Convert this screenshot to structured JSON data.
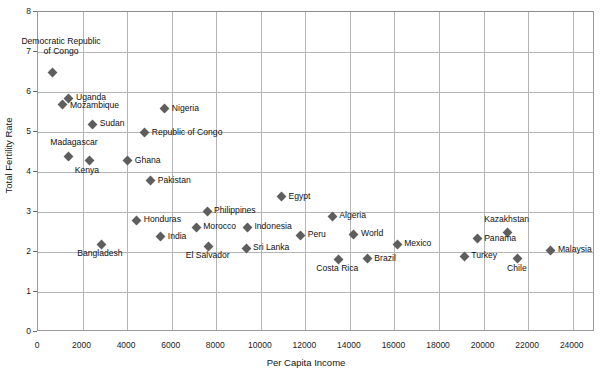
{
  "chart_data": {
    "type": "scatter",
    "title": "",
    "xlabel": "Per Capita Income",
    "ylabel": "Total Fertility Rate",
    "xlim": [
      0,
      25000
    ],
    "ylim": [
      0,
      8
    ],
    "xticks": [
      0,
      2000,
      4000,
      6000,
      8000,
      10000,
      12000,
      14000,
      16000,
      18000,
      20000,
      22000,
      24000
    ],
    "yticks": [
      0,
      1,
      2,
      3,
      4,
      5,
      6,
      7,
      8
    ],
    "xtick_labels": [
      "0",
      "2000",
      "4000",
      "6000",
      "8000",
      "10000",
      "12000",
      "14000",
      "16000",
      "18000",
      "20000",
      "22000",
      "24000"
    ],
    "ytick_labels": [
      "0",
      "1",
      "2",
      "3",
      "4",
      "5",
      "6",
      "7",
      "8"
    ],
    "grid": true,
    "legend": false,
    "marker_color": "#5e5e5e",
    "marker_shape": "diamond",
    "points": [
      {
        "label": "Democratic Republic\nof Congo",
        "x": 630,
        "y": 6.5,
        "label_pos": "above-right",
        "dx": 10,
        "dy": -34
      },
      {
        "label": "Uganda",
        "x": 1390,
        "y": 5.85,
        "label_pos": "right",
        "dx": 8,
        "dy": -4
      },
      {
        "label": "Mozambique",
        "x": 1120,
        "y": 5.68,
        "label_pos": "right",
        "dx": 8,
        "dy": -3
      },
      {
        "label": "Nigeria",
        "x": 5690,
        "y": 5.58,
        "label_pos": "right",
        "dx": 8,
        "dy": -4
      },
      {
        "label": "Sudan",
        "x": 2460,
        "y": 5.2,
        "label_pos": "right",
        "dx": 8,
        "dy": -4
      },
      {
        "label": "Republic of Congo",
        "x": 4790,
        "y": 4.98,
        "label_pos": "right",
        "dx": 8,
        "dy": -4
      },
      {
        "label": "Madagascar",
        "x": 1390,
        "y": 4.4,
        "label_pos": "above",
        "dx": 6,
        "dy": -17
      },
      {
        "label": "Kenya",
        "x": 2330,
        "y": 4.28,
        "label_pos": "below",
        "dx": -2,
        "dy": 6
      },
      {
        "label": "Ghana",
        "x": 4030,
        "y": 4.28,
        "label_pos": "right",
        "dx": 8,
        "dy": -4
      },
      {
        "label": "Pakistan",
        "x": 5060,
        "y": 3.78,
        "label_pos": "right",
        "dx": 8,
        "dy": -4
      },
      {
        "label": "Egypt",
        "x": 10930,
        "y": 3.38,
        "label_pos": "right",
        "dx": 8,
        "dy": -4
      },
      {
        "label": "Philippines",
        "x": 7590,
        "y": 3.02,
        "label_pos": "right",
        "dx": 8,
        "dy": -4
      },
      {
        "label": "Algeria",
        "x": 13210,
        "y": 2.9,
        "label_pos": "right",
        "dx": 8,
        "dy": -4
      },
      {
        "label": "Kazakhstan",
        "x": 21080,
        "y": 2.48,
        "label_pos": "above",
        "dx": 0,
        "dy": -17
      },
      {
        "label": "Honduras",
        "x": 4430,
        "y": 2.8,
        "label_pos": "right",
        "dx": 8,
        "dy": -4
      },
      {
        "label": "Morocco",
        "x": 7100,
        "y": 2.62,
        "label_pos": "right",
        "dx": 8,
        "dy": -4
      },
      {
        "label": "Indonesia",
        "x": 9400,
        "y": 2.62,
        "label_pos": "right",
        "dx": 8,
        "dy": -4
      },
      {
        "label": "Peru",
        "x": 11790,
        "y": 2.42,
        "label_pos": "right",
        "dx": 8,
        "dy": -4
      },
      {
        "label": "World",
        "x": 14180,
        "y": 2.45,
        "label_pos": "right",
        "dx": 8,
        "dy": -4
      },
      {
        "label": "Panama",
        "x": 19710,
        "y": 2.33,
        "label_pos": "right",
        "dx": 8,
        "dy": -4
      },
      {
        "label": "India",
        "x": 5510,
        "y": 2.38,
        "label_pos": "right",
        "dx": 8,
        "dy": -4
      },
      {
        "label": "Mexico",
        "x": 16120,
        "y": 2.2,
        "label_pos": "right",
        "dx": 8,
        "dy": -4
      },
      {
        "label": "Bangladesh",
        "x": 2870,
        "y": 2.2,
        "label_pos": "below",
        "dx": -1,
        "dy": 6
      },
      {
        "label": "Sri Lanka",
        "x": 9340,
        "y": 2.1,
        "label_pos": "right",
        "dx": 8,
        "dy": -4
      },
      {
        "label": "El Salvador",
        "x": 7660,
        "y": 2.15,
        "label_pos": "below",
        "dx": 0,
        "dy": 6
      },
      {
        "label": "Turkey",
        "x": 19130,
        "y": 1.9,
        "label_pos": "right",
        "dx": 8,
        "dy": -4
      },
      {
        "label": "Malaysia",
        "x": 23020,
        "y": 2.05,
        "label_pos": "right",
        "dx": 8,
        "dy": -4
      },
      {
        "label": "Costa Rica",
        "x": 13480,
        "y": 1.82,
        "label_pos": "below",
        "dx": 0,
        "dy": 6
      },
      {
        "label": "Brazil",
        "x": 14780,
        "y": 1.83,
        "label_pos": "right",
        "dx": 8,
        "dy": -4
      },
      {
        "label": "Chile",
        "x": 21540,
        "y": 1.83,
        "label_pos": "below",
        "dx": 0,
        "dy": 6
      }
    ]
  }
}
